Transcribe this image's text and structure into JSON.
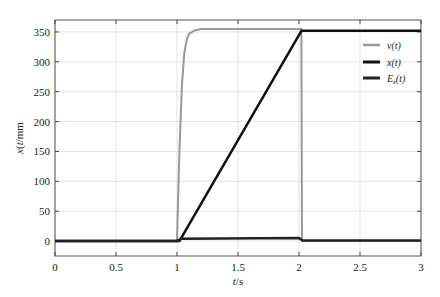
{
  "chart_data": {
    "type": "line",
    "title": "",
    "xlabel": "t/s",
    "ylabel": "x(t)/mm",
    "xlim": [
      0,
      3
    ],
    "ylim": [
      -25,
      370
    ],
    "xticks": [
      0,
      0.5,
      1,
      1.5,
      2,
      2.5,
      3
    ],
    "xtick_labels": [
      "0",
      "0.5",
      "1",
      "1.5",
      "2",
      "2.5",
      "3"
    ],
    "yticks": [
      0,
      50,
      100,
      150,
      200,
      250,
      300,
      350
    ],
    "ytick_labels": [
      "0",
      "50",
      "100",
      "150",
      "200",
      "250",
      "300",
      "350"
    ],
    "grid": true,
    "legend_position": "upper right",
    "series": [
      {
        "name": "v(t)",
        "color": "#999999",
        "width": 2,
        "x": [
          0,
          0.99,
          1.0,
          1.02,
          1.04,
          1.06,
          1.08,
          1.1,
          1.15,
          1.2,
          1.3,
          2.0,
          2.02,
          2.025,
          3
        ],
        "y": [
          0,
          0,
          0,
          150,
          260,
          315,
          338,
          347,
          353,
          355,
          355,
          355,
          355,
          0,
          0
        ]
      },
      {
        "name": "x(t)",
        "color": "#111111",
        "width": 2.5,
        "x": [
          0,
          1.02,
          2.02,
          3
        ],
        "y": [
          0,
          0,
          352,
          352
        ]
      },
      {
        "name": "E_z(t)",
        "color": "#222222",
        "width": 2.5,
        "x": [
          0,
          1.0,
          1.03,
          2.0,
          2.03,
          3
        ],
        "y": [
          0,
          0,
          4,
          5,
          1,
          1
        ]
      }
    ],
    "legend": [
      {
        "label": "v(t)",
        "color": "#999999"
      },
      {
        "label": "x(t)",
        "color": "#111111"
      },
      {
        "label": "E_z(t)",
        "color": "#222222"
      }
    ]
  },
  "labels": {
    "xlabel_t": "t",
    "xlabel_unit": "/s",
    "ylabel_x": "x",
    "ylabel_t": "(t)",
    "ylabel_unit": "/mm",
    "legend_v": "v(t)",
    "legend_x": "x(t)",
    "legend_e_main": "E",
    "legend_e_sub": "z",
    "legend_e_tail": "(t)"
  }
}
